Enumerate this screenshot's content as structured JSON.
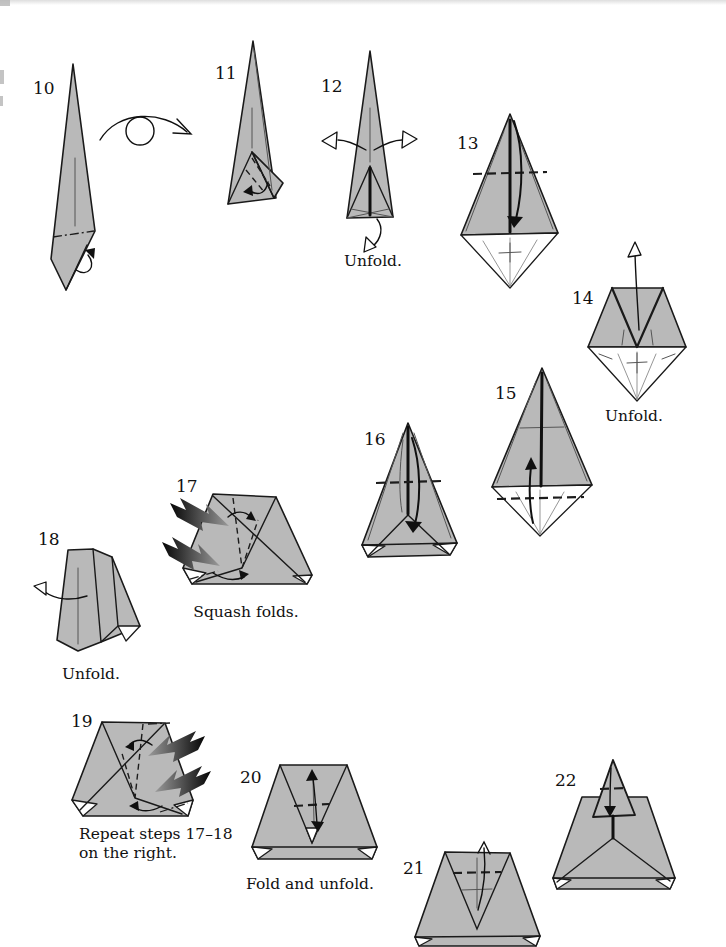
{
  "page": {
    "type": "origami-instruction-page",
    "background": "#ffffff"
  },
  "colors": {
    "paper": "#b9b9b9",
    "line": "#1a1a1a",
    "white": "#ffffff",
    "push_arrow_dark": "#050505",
    "push_arrow_light": "#9a9a9a"
  },
  "icons": {
    "turn_over": "circle-with-arc-arrow",
    "push_arrow": "black-gradient-jagged-arrow",
    "hollow_arrow": "white-outlined-arrowhead"
  },
  "steps": [
    {
      "number": "10"
    },
    {
      "number": "11"
    },
    {
      "number": "12",
      "caption": "Unfold."
    },
    {
      "number": "13"
    },
    {
      "number": "14",
      "caption": "Unfold."
    },
    {
      "number": "15"
    },
    {
      "number": "16"
    },
    {
      "number": "17",
      "caption": "Squash folds."
    },
    {
      "number": "18",
      "caption": "Unfold."
    },
    {
      "number": "19",
      "caption_line1": "Repeat steps 17–18",
      "caption_line2": "on the right."
    },
    {
      "number": "20",
      "caption": "Fold and unfold."
    },
    {
      "number": "21"
    },
    {
      "number": "22"
    }
  ]
}
